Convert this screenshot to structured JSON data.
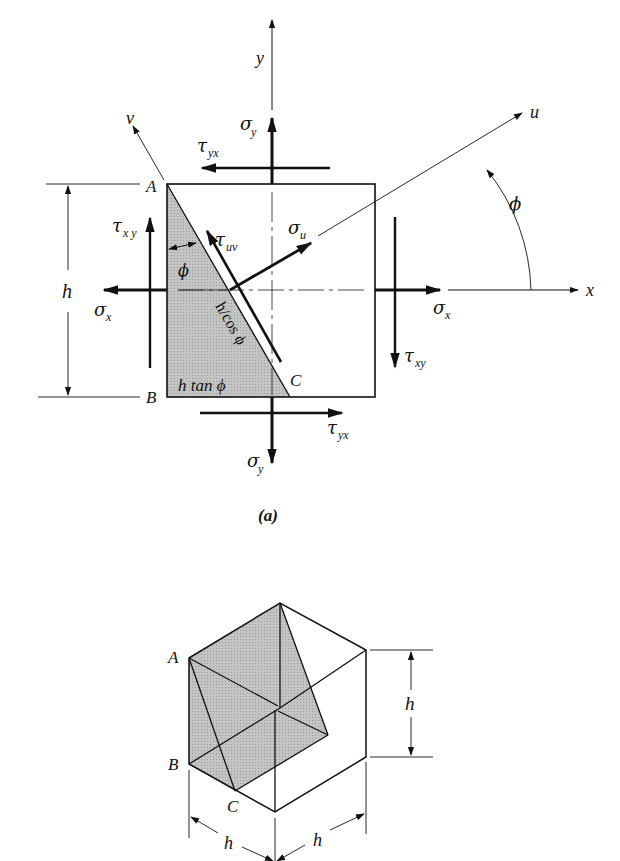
{
  "figure_a": {
    "caption": "(a)",
    "axes": {
      "x": "x",
      "y": "y",
      "u": "u",
      "v": "v"
    },
    "angle_label": "ϕ",
    "corners": {
      "A": "A",
      "B": "B",
      "C": "C"
    },
    "dimension_h": "h",
    "wedge_labels": {
      "hypotenuse": "h/cos ϕ",
      "base": "h tan ϕ",
      "angle": "ϕ"
    },
    "stresses": {
      "sigma_y_top": "σ",
      "sigma_y_top_sub": "y",
      "tau_yx_top": "τ",
      "tau_yx_top_sub": "yx",
      "tau_xy_left": "τ",
      "tau_xy_left_sub": "x y",
      "sigma_x_left": "σ",
      "sigma_x_left_sub": "x",
      "tau_uv": "τ",
      "tau_uv_sub": "uv",
      "sigma_u": "σ",
      "sigma_u_sub": "u",
      "sigma_x_right": "σ",
      "sigma_x_right_sub": "x",
      "tau_xy_right": "τ",
      "tau_xy_right_sub": "xy",
      "tau_yx_bottom": "τ",
      "tau_yx_bottom_sub": "yx",
      "sigma_y_bottom": "σ",
      "sigma_y_bottom_sub": "y"
    }
  },
  "figure_b": {
    "corners": {
      "A": "A",
      "B": "B",
      "C": "C"
    },
    "dimensions": {
      "height": "h",
      "depth_left": "h",
      "depth_right": "h"
    }
  },
  "colors": {
    "ink": "#111111",
    "shade": "#bdbdbd",
    "background": "#ffffff"
  }
}
